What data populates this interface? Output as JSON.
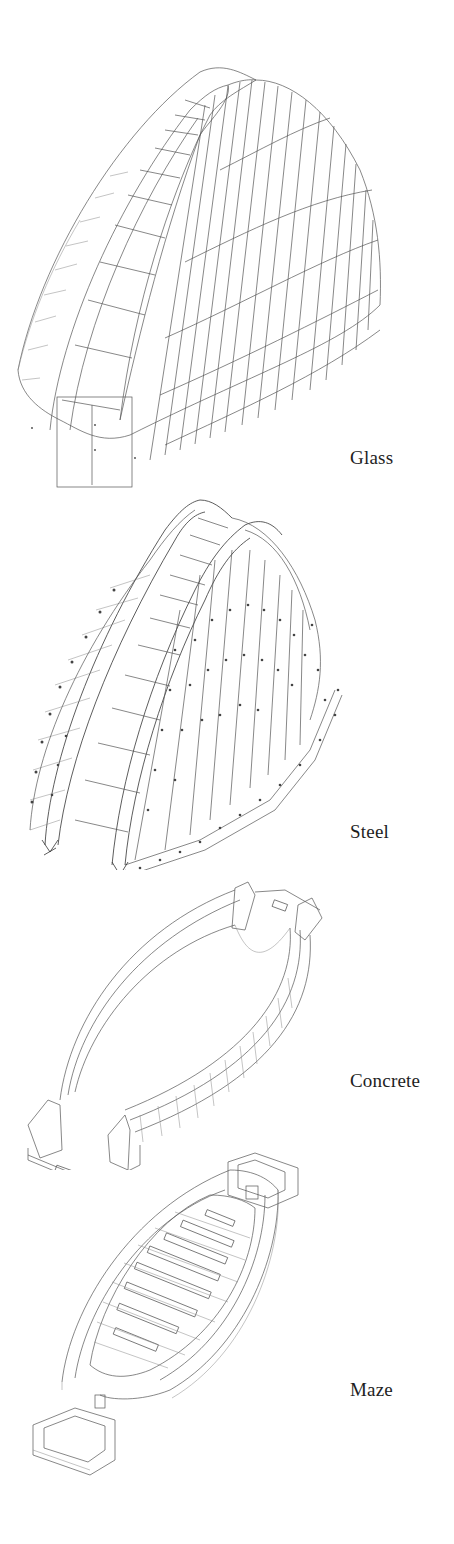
{
  "diagram": {
    "type": "exploded axonometric",
    "layers": [
      {
        "id": "glass",
        "label": "Glass",
        "description": "curved glazed shell with panel grid and entry door"
      },
      {
        "id": "steel",
        "label": "Steel",
        "description": "steel arch frame with ribs and connection nodes"
      },
      {
        "id": "concrete",
        "label": "Concrete",
        "description": "lens-shaped concrete base walls with buttresses"
      },
      {
        "id": "maze",
        "label": "Maze",
        "description": "lens-shaped floor plate with maze of parallel walls and end boxes"
      }
    ]
  },
  "colors": {
    "background": "#ffffff",
    "line": "#555555",
    "text": "#1e1e1e"
  }
}
